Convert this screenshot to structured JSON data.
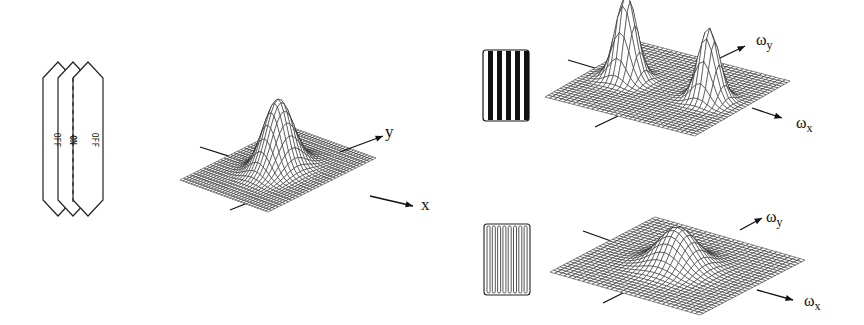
{
  "receptive_field": {
    "labels": [
      "OFF",
      "ON",
      "OFF"
    ]
  },
  "spatial_plot": {
    "x_label": "x",
    "y_label": "y",
    "peaks": [
      {
        "cx": 0,
        "cy": 0,
        "amp": 1.0,
        "sigma": 0.22
      }
    ]
  },
  "frequency_plot_top": {
    "grating": "high-contrast",
    "x_label": "ω",
    "x_sub": "x",
    "y_label": "ω",
    "y_sub": "y",
    "peaks": [
      {
        "cx": -0.55,
        "cy": 0,
        "amp": 1.0,
        "sigma": 0.12
      },
      {
        "cx": 0.55,
        "cy": 0,
        "amp": 0.85,
        "sigma": 0.12
      }
    ]
  },
  "frequency_plot_bottom": {
    "grating": "low-contrast",
    "x_label": "ω",
    "x_sub": "x",
    "y_label": "ω",
    "y_sub": "y",
    "peaks": [
      {
        "cx": 0,
        "cy": 0,
        "amp": 0.55,
        "sigma": 0.22
      }
    ]
  }
}
